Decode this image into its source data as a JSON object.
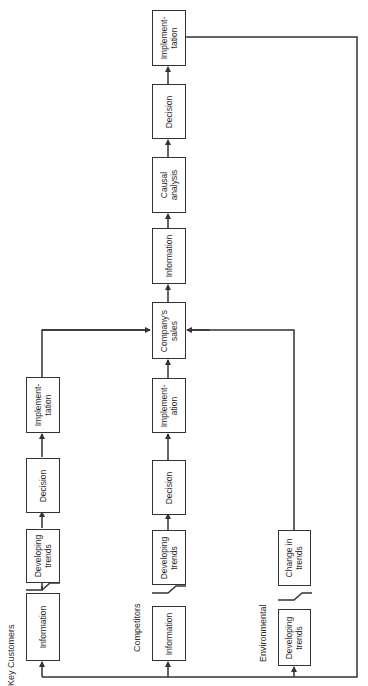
{
  "diagram": {
    "orientation": "rotated-90-ccw",
    "line_color": "#333333",
    "groups": [
      {
        "label": "Key Customers",
        "boxes": [
          {
            "id": "kc-information",
            "text": "Information"
          },
          {
            "id": "kc-developing-trends",
            "text": "Developing\ntrends"
          },
          {
            "id": "kc-decision",
            "text": "Decision"
          },
          {
            "id": "kc-implementation",
            "text": "Implement-\ntation"
          }
        ]
      },
      {
        "label": "Competitors",
        "boxes": [
          {
            "id": "co-information",
            "text": "Information"
          },
          {
            "id": "co-developing-trends",
            "text": "Developing\ntrends"
          },
          {
            "id": "co-decision",
            "text": "Decision"
          },
          {
            "id": "co-implementation",
            "text": "Implement-\nation"
          }
        ]
      },
      {
        "label": "Environmental",
        "boxes": [
          {
            "id": "env-developing-trends",
            "text": "Developing\ntrends"
          },
          {
            "id": "env-change-in-trends",
            "text": "Change in\ntrends"
          }
        ]
      }
    ],
    "main_chain": [
      {
        "id": "companys-sales",
        "text": "Company's\nsales"
      },
      {
        "id": "main-information",
        "text": "Information"
      },
      {
        "id": "causal-analysis",
        "text": "Causal\nanalysis"
      },
      {
        "id": "main-decision",
        "text": "Decision"
      },
      {
        "id": "main-implementation",
        "text": "Implement-\ntation"
      }
    ]
  }
}
